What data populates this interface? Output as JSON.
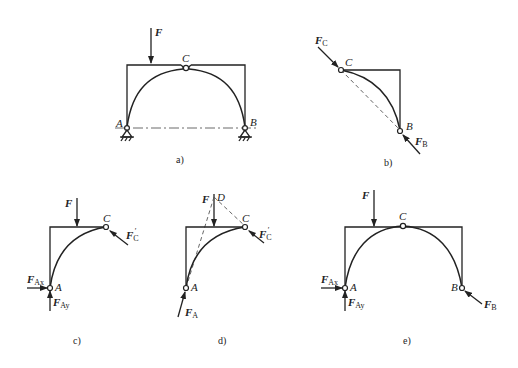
{
  "figure": {
    "panels": [
      {
        "id": "a",
        "caption": "a)",
        "labels": {
          "force": "F",
          "hinge": "C",
          "left_support": "A",
          "right_support": "B"
        }
      },
      {
        "id": "b",
        "caption": "b)",
        "labels": {
          "hinge": "C",
          "support": "B",
          "force_c": "F",
          "force_c_sub": "C",
          "force_b": "F",
          "force_b_sub": "B"
        }
      },
      {
        "id": "c",
        "caption": "c)",
        "labels": {
          "force": "F",
          "hinge": "C",
          "support": "A",
          "force_c": "F",
          "force_c_sub": "C",
          "force_c_prime": "′",
          "force_ax": "F",
          "force_ax_sub": "Ax",
          "force_ay": "F",
          "force_ay_sub": "Ay"
        }
      },
      {
        "id": "d",
        "caption": "d)",
        "labels": {
          "force": "F",
          "point_d": "D",
          "hinge": "C",
          "support": "A",
          "force_c": "F",
          "force_c_sub": "C",
          "force_c_prime": "′",
          "force_a": "F",
          "force_a_sub": "A"
        }
      },
      {
        "id": "e",
        "caption": "e)",
        "labels": {
          "force": "F",
          "hinge": "C",
          "support_a": "A",
          "support_b": "B",
          "force_ax": "F",
          "force_ax_sub": "Ax",
          "force_ay": "F",
          "force_ay_sub": "Ay",
          "force_b": "F",
          "force_b_sub": "B"
        }
      }
    ]
  }
}
